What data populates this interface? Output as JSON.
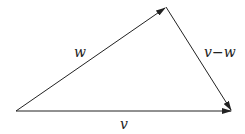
{
  "diagram": {
    "type": "vector-triangle",
    "labels": {
      "w": "w",
      "v_minus_w": "v−w",
      "v": "v"
    },
    "points": {
      "origin": [
        16,
        111
      ],
      "w_tip": [
        166,
        7
      ],
      "v_tip": [
        232,
        111
      ]
    },
    "stroke_color": "#222222"
  }
}
